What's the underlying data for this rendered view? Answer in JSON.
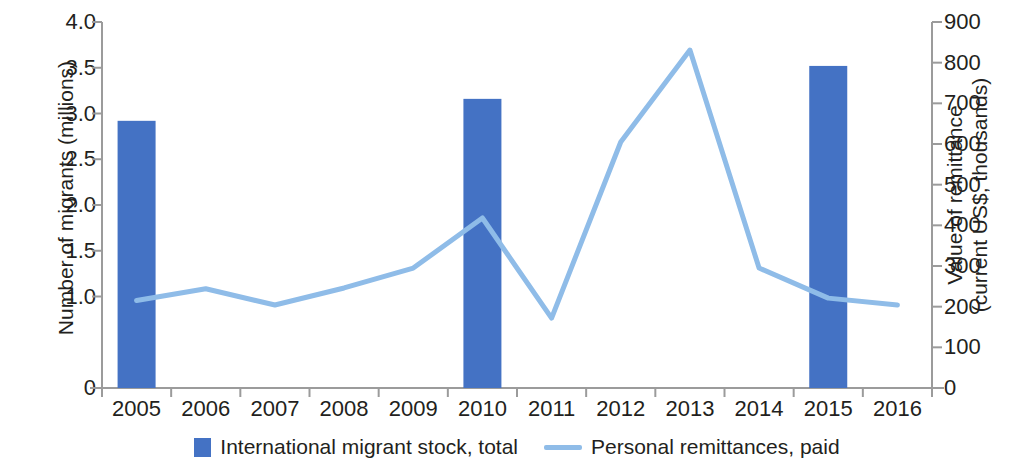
{
  "chart_data": {
    "type": "bar",
    "title": "",
    "subtitle": "",
    "categories": [
      "2005",
      "2006",
      "2007",
      "2008",
      "2009",
      "2010",
      "2011",
      "2012",
      "2013",
      "2014",
      "2015",
      "2016"
    ],
    "xlabel": "",
    "grid": false,
    "legend_position": "bottom",
    "axes": {
      "left": {
        "label": "Number of migrants (millions)",
        "label_line1": "Number of migrants (millions)",
        "ticks": [
          "0",
          "1.0",
          "1.5",
          "2.0",
          "2.5",
          "3.0",
          "3.5",
          "4.0"
        ],
        "tick_values": [
          0,
          1.0,
          1.5,
          2.0,
          2.5,
          3.0,
          3.5,
          4.0
        ],
        "ylim": [
          0,
          4.0
        ]
      },
      "right": {
        "label": "Value of remittance (current US$, thousands)",
        "label_line1": "Value of remittance",
        "label_line2": "(current US$, thousands)",
        "ticks": [
          "0",
          "100",
          "200",
          "300",
          "400",
          "500",
          "600",
          "700",
          "800",
          "900"
        ],
        "tick_values": [
          0,
          100,
          200,
          300,
          400,
          500,
          600,
          700,
          800,
          900
        ],
        "ylim": [
          0,
          900
        ]
      }
    },
    "series": [
      {
        "name": "International migrant stock, total",
        "type": "bar",
        "axis": "left",
        "color": "#4472c4",
        "unit": "millions",
        "points": [
          {
            "x": "2005",
            "y": 2.92
          },
          {
            "x": "2010",
            "y": 3.16
          },
          {
            "x": "2015",
            "y": 3.52
          }
        ],
        "values": [
          2.92,
          null,
          null,
          null,
          null,
          3.16,
          null,
          null,
          null,
          null,
          3.52,
          null
        ]
      },
      {
        "name": "Personal remittances, paid",
        "type": "line",
        "axis": "right",
        "color": "#8fbce8",
        "unit": "thousands of current US$",
        "values": [
          215,
          244,
          204,
          246,
          295,
          418,
          172,
          605,
          831,
          295,
          221,
          204
        ]
      }
    ]
  },
  "legend": {
    "items": [
      {
        "label": "International migrant stock, total",
        "marker": "bar-swatch",
        "color": "#4472c4"
      },
      {
        "label": "Personal remittances, paid",
        "marker": "line-swatch",
        "color": "#8fbce8"
      }
    ]
  },
  "colors": {
    "bar": "#4472c4",
    "line": "#8fbce8",
    "axis": "#9b9b9b",
    "text": "#231f20",
    "background": "#ffffff"
  }
}
